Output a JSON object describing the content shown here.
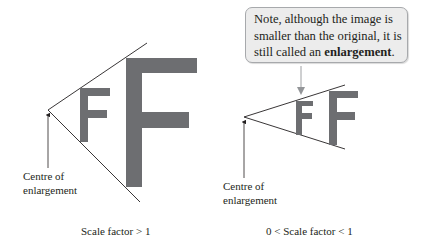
{
  "colors": {
    "letter_fill": "#6d6e71",
    "line": "#231f20",
    "callout_fill": "#ececec",
    "callout_border": "#a7a9ac",
    "callout_arrow": "#939598"
  },
  "left_diagram": {
    "object_letter": "F",
    "image_letter": "F",
    "centre_label_line1": "Centre of",
    "centre_label_line2": "enlargement",
    "caption": "Scale factor > 1"
  },
  "right_diagram": {
    "object_letter": "F",
    "image_letter": "F",
    "centre_label_line1": "Centre of",
    "centre_label_line2": "enlargement",
    "caption": "0 < Scale factor < 1",
    "callout": {
      "text_before": "Note, although the image is smaller than the original, it is still called an ",
      "text_bold": "enlargement",
      "text_after": "."
    }
  }
}
